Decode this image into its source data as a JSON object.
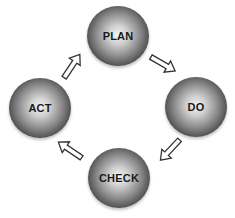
{
  "diagram": {
    "type": "cycle",
    "title": "",
    "nodes": [
      {
        "id": "plan",
        "label": "PLAN"
      },
      {
        "id": "do",
        "label": "DO"
      },
      {
        "id": "check",
        "label": "CHECK"
      },
      {
        "id": "act",
        "label": "ACT"
      }
    ],
    "edges": [
      {
        "from": "PLAN",
        "to": "DO"
      },
      {
        "from": "DO",
        "to": "CHECK"
      },
      {
        "from": "CHECK",
        "to": "ACT"
      },
      {
        "from": "ACT",
        "to": "PLAN"
      }
    ]
  },
  "colors": {
    "background": "#ffffff",
    "node_dark": "#151515",
    "node_highlight": "#f4f4f4",
    "label": "#1a1a1a",
    "arrow_outline": "#333333",
    "arrow_fill": "#ffffff"
  }
}
